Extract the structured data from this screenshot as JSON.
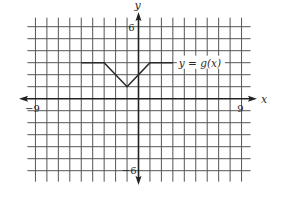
{
  "chart_data": {
    "type": "line",
    "title": "",
    "xlabel": "x",
    "ylabel": "y",
    "xlim": [
      -9,
      9
    ],
    "ylim": [
      -6,
      6
    ],
    "grid": true,
    "grid_step": 1,
    "x_tick_labels": [
      {
        "value": -9,
        "label": "−9"
      },
      {
        "value": 9,
        "label": "9"
      }
    ],
    "y_tick_labels": [
      {
        "value": 6,
        "label": "6"
      },
      {
        "value": -6,
        "label": "−6"
      }
    ],
    "series": [
      {
        "name": "y = g(x)",
        "points": [
          [
            -5,
            3
          ],
          [
            -3,
            3
          ],
          [
            -1,
            1
          ],
          [
            0,
            2
          ],
          [
            1,
            3
          ],
          [
            3,
            3
          ]
        ]
      }
    ],
    "annotations": [
      {
        "text": "y = g(x)",
        "x": 3,
        "y": 3,
        "position": "right-of-line-end"
      }
    ],
    "legend": "inline label at right end of curve"
  },
  "colors": {
    "grid": "#555555",
    "axis": "#222222",
    "curve": "#2a2a2a",
    "text": "#2a2a2a",
    "background": "#ffffff"
  }
}
